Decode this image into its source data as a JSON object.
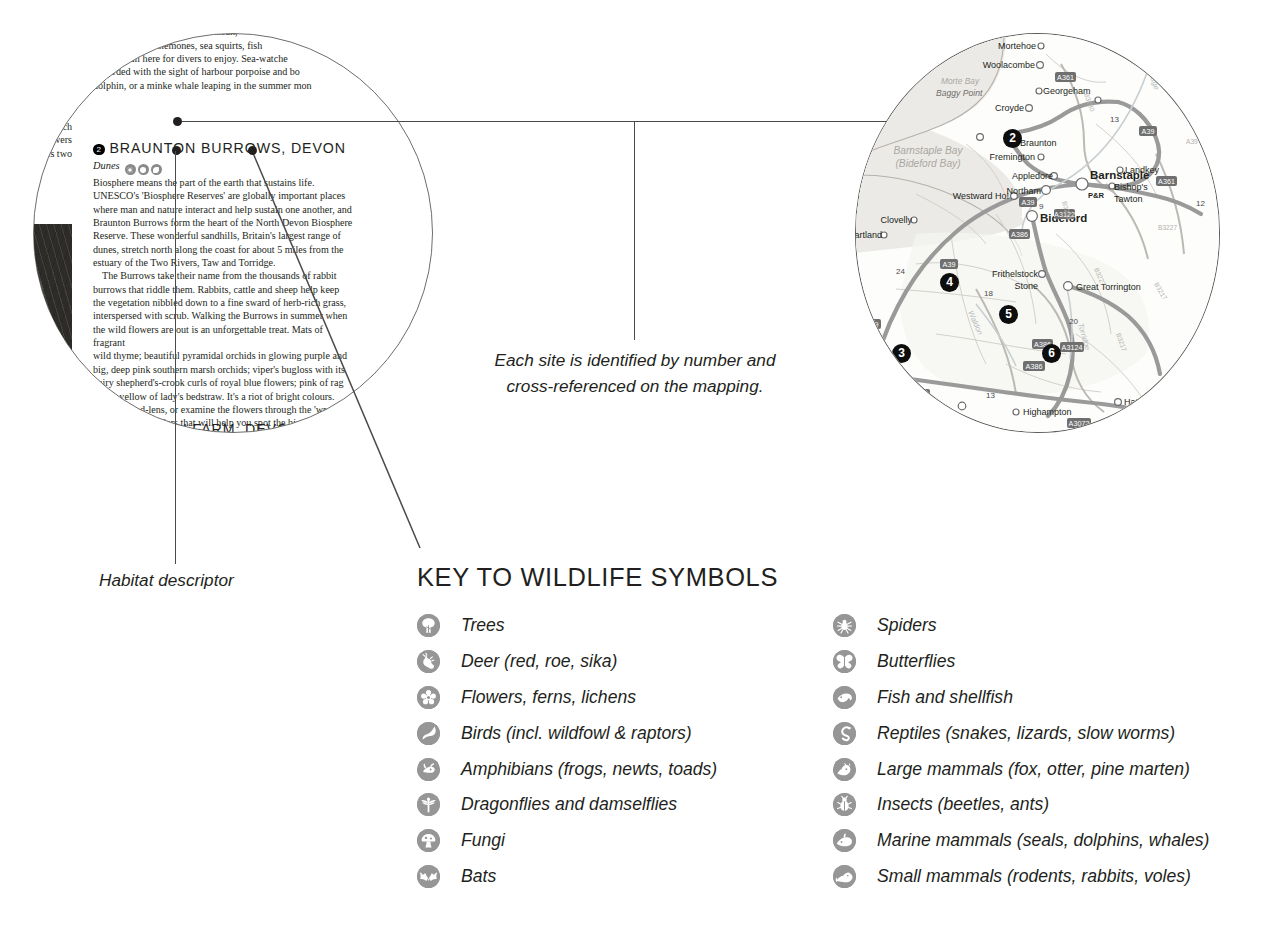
{
  "book_page": {
    "left_column_lines": [
      "d). Now",
      "h array of",
      "arley-Davidson",
      "orbill and",
      "d Manx shearwaters",
      "de the Lundy cabbage",
      "the world), which",
      "r-petalled yellow flowers",
      "you'll also spot its two"
    ],
    "right_column_top": [
      "r definitely very)",
      "The seas around Lundy are clean,",
      "Corals and sea anemones, sea squirts, fish",
      "seals are all here for divers to enjoy. Sea-watche",
      "rewarded with the sight of harbour porpoise and bo",
      "dolphin, or a minke whale leaping in the summer mon"
    ],
    "site_2": {
      "number": "2",
      "title": "BRAUNTON BURROWS, DEVON",
      "habitat": "Dunes",
      "habitat_icons": [
        "flowers-icon",
        "butterflies-icon",
        "fish-icon"
      ],
      "body": [
        "Biosphere means the part of the earth that sustains life.",
        "UNESCO's 'Biosphere Reserves' are globally important places",
        "where man and nature interact and help sustain one another, and",
        "Braunton Burrows form the heart of the North Devon Biosphere",
        "Reserve. These wonderful sandhills, Britain's largest range of",
        "dunes, stretch north along the coast for about 5 miles from the",
        "estuary of the Two Rivers, Taw and Torridge.",
        "The Burrows take their name from the thousands of rabbit",
        "burrows that riddle them. Rabbits, cattle and sheep help keep",
        "the vegetation nibbled down to a fine sward of herb-rich grass,",
        "interspersed with scrub. Walking the Burrows in summer when",
        "the wild flowers are out is an unforgettable treat. Mats of fragrant",
        "wild thyme; beautiful pyramidal orchids in glowing purple and",
        "big, deep pink southern marsh orchids; viper's bugloss with its",
        "hairy shepherd's-crook curls of royal blue flowers; pink of rag",
        "robin, yellow of lady's bedstraw. It's a riot of bright colours.",
        "Bring a hand-lens, or examine the flowers through the 'wr",
        "end of the binoculars that will help you spot the birds w",
        "sweetest songs – blackcaps, whitethroats and skylar"
      ]
    },
    "site_3": {
      "number": "3",
      "title": "DUNSDON FARM, DEVON",
      "habitat": "Mixed habitat",
      "habitat_icons": [
        "flowers-icon",
        "butterflies-icon",
        "fish-icon"
      ]
    },
    "photo_caption": "puffin-photograph"
  },
  "annotations": {
    "center_note": "Each site is identified by number and cross-referenced on the mapping.",
    "habitat_descriptor": "Habitat descriptor"
  },
  "map": {
    "sea_labels": [
      "Morte Bay",
      "Barnstaple Bay",
      "(Bideford Bay)"
    ],
    "places": [
      {
        "name": "Mortehoe",
        "x": 173,
        "y": 13,
        "bold": false,
        "anchor": "end"
      },
      {
        "name": "Woolacombe",
        "x": 178,
        "y": 32,
        "bold": false,
        "anchor": "end"
      },
      {
        "name": "Georgeham",
        "x": 186,
        "y": 57,
        "bold": false,
        "anchor": "start"
      },
      {
        "name": "Croyde",
        "x": 167,
        "y": 75,
        "bold": false,
        "anchor": "end"
      },
      {
        "name": "Braunton",
        "x": 164,
        "y": 103,
        "bold": false,
        "anchor": "start"
      },
      {
        "name": "Fremington",
        "x": 178,
        "y": 124,
        "bold": false,
        "anchor": "end"
      },
      {
        "name": "Barnstaple",
        "x": 256,
        "y": 118,
        "bold": true,
        "anchor": "start"
      },
      {
        "name": "Appledore",
        "x": 196,
        "y": 143,
        "bold": false,
        "anchor": "end"
      },
      {
        "name": "Northam",
        "x": 186,
        "y": 157,
        "bold": false,
        "anchor": "end"
      },
      {
        "name": "Westward Ho!",
        "x": 152,
        "y": 163,
        "bold": false,
        "anchor": "end"
      },
      {
        "name": "Landkey",
        "x": 268,
        "y": 137,
        "bold": false,
        "anchor": "start"
      },
      {
        "name": "Bishop's",
        "x": 262,
        "y": 152,
        "bold": false,
        "anchor": "start"
      },
      {
        "name": "Tawton",
        "x": 262,
        "y": 165,
        "bold": false,
        "anchor": "start"
      },
      {
        "name": "Bideford",
        "x": 180,
        "y": 185,
        "bold": true,
        "anchor": "start"
      },
      {
        "name": "Clovelly",
        "x": 62,
        "y": 186,
        "bold": false,
        "anchor": "start"
      },
      {
        "name": "Hartland",
        "x": 30,
        "y": 200,
        "bold": false,
        "anchor": "start"
      },
      {
        "name": "Frithelstock",
        "x": 150,
        "y": 238,
        "bold": false,
        "anchor": "start"
      },
      {
        "name": "Stone",
        "x": 158,
        "y": 251,
        "bold": false,
        "anchor": "start"
      },
      {
        "name": "Great Torrington",
        "x": 222,
        "y": 252,
        "bold": false,
        "anchor": "start"
      },
      {
        "name": "Highampton",
        "x": 165,
        "y": 377,
        "bold": false,
        "anchor": "start"
      },
      {
        "name": "Hatherleigh",
        "x": 265,
        "y": 366,
        "bold": false,
        "anchor": "start"
      },
      {
        "name": "P&R",
        "x": 240,
        "y": 148,
        "bold": true,
        "anchor": "start"
      }
    ],
    "road_badges": [
      "A361",
      "A39",
      "A39",
      "A39",
      "A39",
      "A361",
      "A386",
      "A386",
      "A3124",
      "A386",
      "A3072",
      "A3072",
      "A377"
    ],
    "distance_numbers": [
      "13",
      "12",
      "9",
      "24",
      "18",
      "20",
      "13",
      "18"
    ],
    "river_labels": [
      "Torridge",
      "Torridge",
      "Waldon"
    ],
    "site_markers": [
      {
        "number": "2",
        "x": 150,
        "y": 103
      },
      {
        "number": "3",
        "x": 40,
        "y": 319
      },
      {
        "number": "4",
        "x": 88,
        "y": 248
      },
      {
        "number": "5",
        "x": 147,
        "y": 280
      },
      {
        "number": "6",
        "x": 190,
        "y": 319
      }
    ]
  },
  "key": {
    "title": "KEY TO WILDLIFE SYMBOLS",
    "left_items": [
      {
        "icon": "trees-icon",
        "label": "Trees"
      },
      {
        "icon": "deer-icon",
        "label": "Deer (red, roe, sika)"
      },
      {
        "icon": "flowers-icon",
        "label": "Flowers, ferns, lichens"
      },
      {
        "icon": "birds-icon",
        "label": "Birds (incl. wildfowl & raptors)"
      },
      {
        "icon": "amphibians-icon",
        "label": "Amphibians (frogs, newts, toads)"
      },
      {
        "icon": "dragonflies-icon",
        "label": "Dragonflies and damselflies"
      },
      {
        "icon": "fungi-icon",
        "label": "Fungi"
      },
      {
        "icon": "bats-icon",
        "label": "Bats"
      }
    ],
    "right_items": [
      {
        "icon": "spiders-icon",
        "label": "Spiders"
      },
      {
        "icon": "butterflies-icon",
        "label": "Butterflies"
      },
      {
        "icon": "fish-icon",
        "label": "Fish and shellfish"
      },
      {
        "icon": "reptiles-icon",
        "label": "Reptiles (snakes, lizards, slow worms)"
      },
      {
        "icon": "large-mammals-icon",
        "label": "Large mammals (fox, otter, pine marten)"
      },
      {
        "icon": "insects-icon",
        "label": "Insects (beetles, ants)"
      },
      {
        "icon": "marine-mammals-icon",
        "label": "Marine mammals (seals, dolphins, whales)"
      },
      {
        "icon": "small-mammals-icon",
        "label": "Small mammals (rodents, rabbits, voles)"
      }
    ]
  },
  "colors": {
    "ink": "#231f20",
    "icon_grey": "#969696",
    "marker_black": "#0d0d0d",
    "sea": "#eceae6",
    "road_grey": "#9a9a9a"
  }
}
